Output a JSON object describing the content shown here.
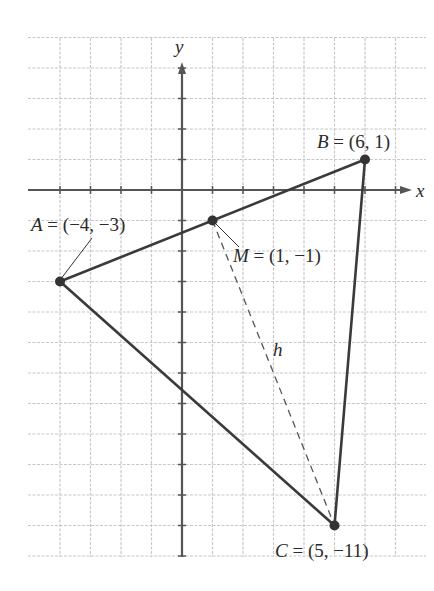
{
  "diagram": {
    "type": "coordinate-plane-triangle",
    "axes": {
      "x_label": "x",
      "y_label": "y",
      "x_grid_range": [
        -4,
        7
      ],
      "y_grid_range": [
        -12,
        5
      ]
    },
    "points": [
      {
        "name": "A",
        "x": -4,
        "y": -3,
        "label": "A = (−4, −3)",
        "letter": "A",
        "coords": " = (−4, −3)"
      },
      {
        "name": "B",
        "x": 6,
        "y": 1,
        "label": "B = (6, 1)",
        "letter": "B",
        "coords": " = (6, 1)"
      },
      {
        "name": "C",
        "x": 5,
        "y": -11,
        "label": "C = (5, −11)",
        "letter": "C",
        "coords": " = (5, −11)"
      },
      {
        "name": "M",
        "x": 1,
        "y": -1,
        "label": "M = (1, −1)",
        "letter": "M",
        "coords": " = (1, −1)"
      }
    ],
    "segments": [
      "AB",
      "BC",
      "CA"
    ],
    "dashed_segment": {
      "from": "M",
      "to": "C",
      "label": "h"
    },
    "colors": {
      "grid": "#c8c8c8",
      "axis": "#555555",
      "line": "#3a3a3a",
      "point": "#333333"
    }
  }
}
